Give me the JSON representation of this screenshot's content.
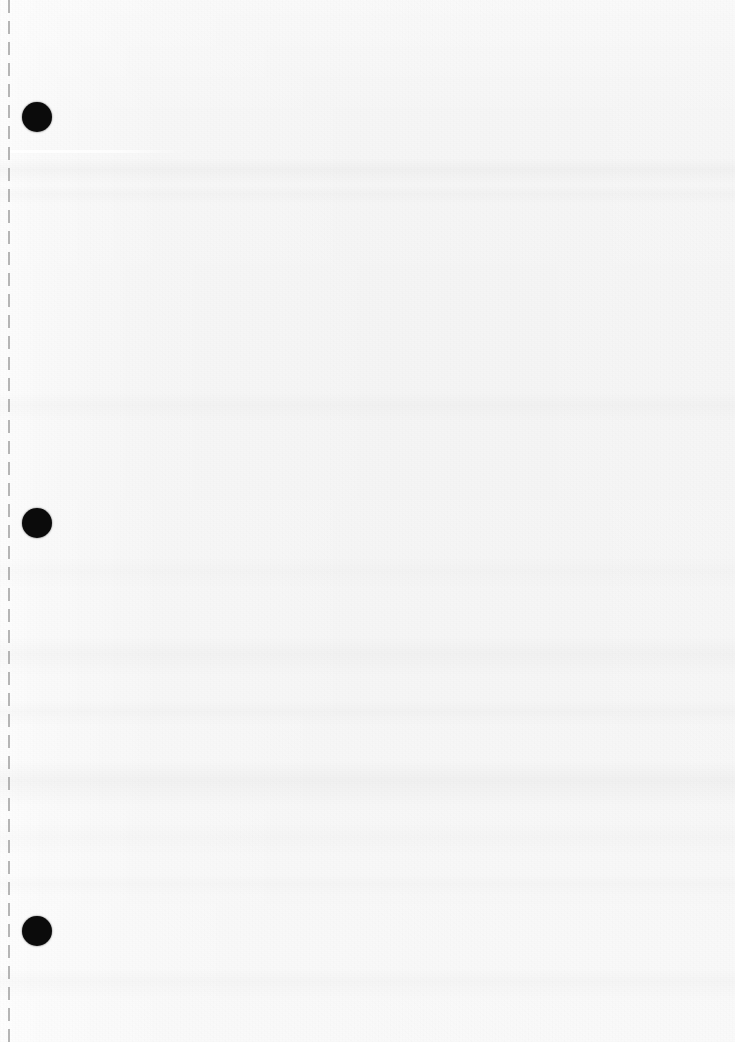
{
  "page": {
    "kind": "scanned-blank-sheet",
    "width_px": 735,
    "height_px": 1042,
    "body_text": "",
    "paper_color": "#f4f4f4",
    "ink_color": "#0b0b0b"
  },
  "perforation": {
    "name": "dashed-tear-line",
    "x_px": 8,
    "color": "#9a9a9a",
    "dash_length_px": 13,
    "gap_length_px": 8,
    "thickness_px": 2
  },
  "holes": [
    {
      "label": "hole-1",
      "cx": 37,
      "cy": 117,
      "diameter": 30
    },
    {
      "label": "hole-2",
      "cx": 37,
      "cy": 523,
      "diameter": 30
    },
    {
      "label": "hole-3",
      "cx": 37,
      "cy": 931,
      "diameter": 30
    }
  ],
  "scan_artifacts": {
    "streak": {
      "label": "bright-streak",
      "x": 10,
      "y": 150,
      "width": 180,
      "height": 3
    },
    "bands": [
      {
        "label": "band-1",
        "y": 158,
        "height": 26,
        "shade": "rgba(0,0,0,0.022)"
      },
      {
        "label": "band-2",
        "y": 186,
        "height": 18,
        "shade": "rgba(0,0,0,0.014)"
      },
      {
        "label": "band-3",
        "y": 392,
        "height": 30,
        "shade": "rgba(0,0,0,0.016)"
      },
      {
        "label": "band-4",
        "y": 556,
        "height": 34,
        "shade": "rgba(0,0,0,0.013)"
      },
      {
        "label": "band-5",
        "y": 636,
        "height": 40,
        "shade": "rgba(0,0,0,0.020)"
      },
      {
        "label": "band-6",
        "y": 700,
        "height": 26,
        "shade": "rgba(0,0,0,0.014)"
      },
      {
        "label": "band-7",
        "y": 760,
        "height": 46,
        "shade": "rgba(0,0,0,0.026)"
      },
      {
        "label": "band-8",
        "y": 822,
        "height": 34,
        "shade": "rgba(0,0,0,0.012)"
      },
      {
        "label": "band-9",
        "y": 874,
        "height": 22,
        "shade": "rgba(0,0,0,0.010)"
      },
      {
        "label": "band-10",
        "y": 968,
        "height": 30,
        "shade": "rgba(0,0,0,0.015)"
      }
    ]
  }
}
